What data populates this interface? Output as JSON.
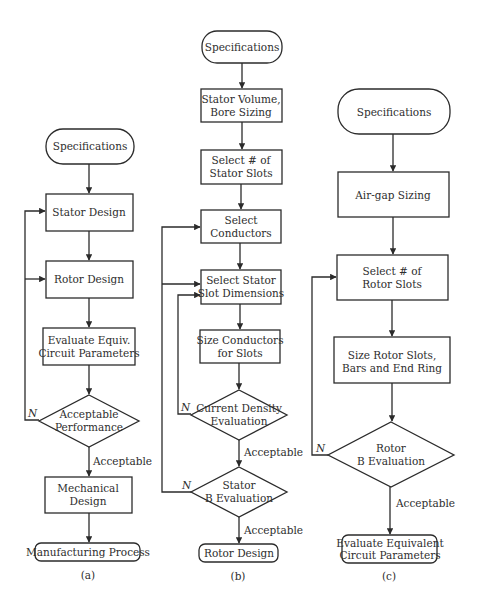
{
  "figure": {
    "panels": [
      {
        "id": "a",
        "caption": "(a)",
        "nodes": {
          "start": "Specifications",
          "stator": "Stator Design",
          "rotor": "Rotor Design",
          "equiv": [
            "Evaluate Equiv.",
            "Circuit Parameters"
          ],
          "decision": [
            "Acceptable",
            "Performance"
          ],
          "mechanical": [
            "Mechanical",
            "Design"
          ],
          "end": "Manufacturing Process"
        },
        "edge_labels": {
          "no": "N",
          "yes": "Acceptable"
        }
      },
      {
        "id": "b",
        "caption": "(b)",
        "nodes": {
          "start": "Specifications",
          "volume": [
            "Stator Volume,",
            "Bore Sizing"
          ],
          "slots": [
            "Select # of",
            "Stator Slots"
          ],
          "conductors": [
            "Select",
            "Conductors"
          ],
          "slot_dims": [
            "Select Stator",
            "Slot Dimensions"
          ],
          "size_conductors": [
            "Size Conductors",
            "for Slots"
          ],
          "current_density": [
            "Current Density",
            "Evaluation"
          ],
          "stator_b": [
            "Stator",
            "B Evaluation"
          ],
          "end": "Rotor Design"
        },
        "edge_labels": {
          "no1": "N",
          "yes1": "Acceptable",
          "no2": "N",
          "yes2": "Acceptable"
        }
      },
      {
        "id": "c",
        "caption": "(c)",
        "nodes": {
          "start": "Specifications",
          "airgap": "Air-gap Sizing",
          "rotor_slots": [
            "Select # of",
            "Rotor Slots"
          ],
          "size_rotor": [
            "Size Rotor Slots,",
            "Bars and End Ring"
          ],
          "rotor_b": [
            "Rotor",
            "B Evaluation"
          ],
          "end": [
            "Evaluate Equivalent",
            "Circuit Parameters"
          ]
        },
        "edge_labels": {
          "no": "N",
          "yes": "Acceptable"
        }
      }
    ]
  }
}
